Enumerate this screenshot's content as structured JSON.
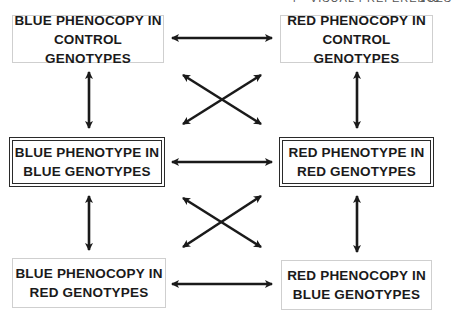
{
  "running_head": {
    "section": "4 · VISUAL PREFERENCES",
    "page": "143"
  },
  "boxes": {
    "top_left": {
      "line1": "BLUE PHENOCOPY IN",
      "line2": "CONTROL GENOTYPES",
      "border": "single"
    },
    "top_right": {
      "line1": "RED PHENOCOPY IN",
      "line2": "CONTROL GENOTYPES",
      "border": "single"
    },
    "mid_left": {
      "line1": "BLUE PHENOTYPE IN",
      "line2": "BLUE GENOTYPES",
      "border": "double"
    },
    "mid_right": {
      "line1": "RED PHENOTYPE IN",
      "line2": "RED GENOTYPES",
      "border": "double"
    },
    "bottom_left": {
      "line1": "BLUE PHENOCOPY IN",
      "line2": "RED GENOTYPES",
      "border": "single"
    },
    "bottom_right": {
      "line1": "RED PHENOCOPY IN",
      "line2": "BLUE GENOTYPES",
      "border": "single"
    }
  },
  "connections": [
    {
      "from": "top_left",
      "to": "top_right",
      "type": "bidirectional"
    },
    {
      "from": "mid_left",
      "to": "mid_right",
      "type": "bidirectional"
    },
    {
      "from": "bottom_left",
      "to": "bottom_right",
      "type": "bidirectional"
    },
    {
      "from": "top_left",
      "to": "mid_left",
      "type": "bidirectional"
    },
    {
      "from": "mid_left",
      "to": "bottom_left",
      "type": "bidirectional"
    },
    {
      "from": "top_right",
      "to": "mid_right",
      "type": "bidirectional"
    },
    {
      "from": "mid_right",
      "to": "bottom_right",
      "type": "bidirectional"
    },
    {
      "from": "top_left",
      "to": "mid_right",
      "type": "bidirectional"
    },
    {
      "from": "top_right",
      "to": "mid_left",
      "type": "bidirectional"
    },
    {
      "from": "mid_left",
      "to": "bottom_right",
      "type": "bidirectional"
    },
    {
      "from": "mid_right",
      "to": "bottom_left",
      "type": "bidirectional"
    }
  ],
  "colors": {
    "ink": "#1a1a1a",
    "box_border_light": "#cfcfcf"
  }
}
